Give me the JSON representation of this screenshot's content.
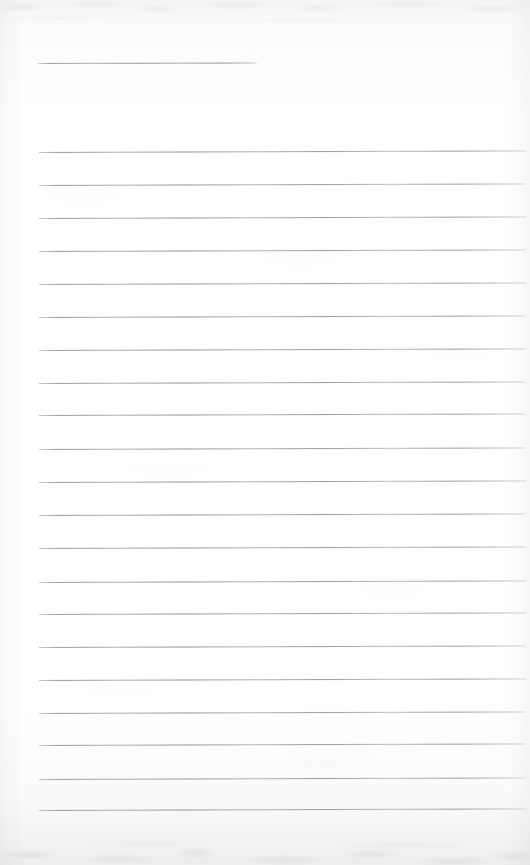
{
  "document": {
    "kind": "scanned-ruled-notepad-page",
    "title": "",
    "body_text": "",
    "page_width": 530,
    "page_height": 865,
    "background_color": "#fdfdfd",
    "rule_color": "#9ea1a7",
    "rule_thickness_px": 1,
    "is_blank": true,
    "visible_text_count": 0
  },
  "rules": {
    "short_rule": {
      "name": "top-short-rule",
      "x": 38,
      "y": 63,
      "width": 219,
      "skew_deg": -0.12
    },
    "body_left_x": 39,
    "body_width": 487,
    "body_spacing_px": 32.9,
    "body_skew_deg": -0.18,
    "body_count": 21,
    "body_y_positions": [
      152,
      185,
      218,
      251,
      284,
      317,
      350,
      383,
      415,
      449,
      482,
      515,
      548,
      582,
      614,
      647,
      680,
      713,
      745,
      779,
      810
    ]
  }
}
